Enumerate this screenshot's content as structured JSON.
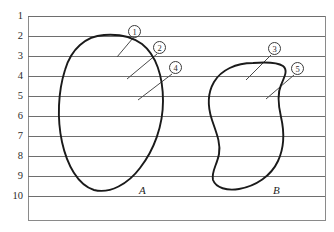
{
  "figure": {
    "type": "ruled-line-diagram",
    "frame": {
      "x": 28,
      "y": 16,
      "width": 297,
      "height": 204,
      "border_color": "#8a8a8a"
    },
    "line_color": "#6e6e6e",
    "outline_color": "#1a1a1a",
    "background": "#ffffff"
  },
  "ruled_lines": {
    "label_header": "row",
    "rows": [
      {
        "label": "1",
        "y": 16
      },
      {
        "label": "2",
        "y": 36
      },
      {
        "label": "3",
        "y": 56
      },
      {
        "label": "4",
        "y": 76
      },
      {
        "label": "5",
        "y": 96
      },
      {
        "label": "6",
        "y": 116
      },
      {
        "label": "7",
        "y": 136
      },
      {
        "label": "8",
        "y": 156
      },
      {
        "label": "9",
        "y": 176
      },
      {
        "label": "10",
        "y": 196
      }
    ]
  },
  "shapes": [
    {
      "id": "shape-a",
      "label": "A",
      "label_x": 139,
      "label_y": 184,
      "path": "M 104 35 C 86 36, 71 49, 65 70 C 58 92, 57 119, 62 142 C 67 165, 78 185, 94 190 C 110 194, 128 184, 140 168 C 154 150, 163 126, 163 101 C 163 76, 156 55, 142 44 C 131 36, 117 34, 104 35 Z"
    },
    {
      "id": "shape-b",
      "label": "B",
      "label_x": 273,
      "label_y": 184,
      "path": "M 253 63 C 236 63, 221 70, 214 82 C 207 94, 208 108, 212 120 C 216 132, 221 143, 219 154 C 217 165, 211 172, 213 180 C 216 188, 227 191, 239 189 C 256 186, 271 176, 278 161 C 285 146, 284 130, 281 117 C 278 104, 277 94, 281 85 C 285 76, 288 70, 283 66 C 277 62, 265 62, 253 63 Z"
    }
  ],
  "callouts": [
    {
      "id": "callout-1",
      "label": "①",
      "plain": "1",
      "circle_x": 128,
      "circle_y": 25,
      "leader": {
        "x1": 133,
        "y1": 38,
        "x2": 117,
        "y2": 57
      }
    },
    {
      "id": "callout-2",
      "label": "②",
      "plain": "2",
      "circle_x": 153,
      "circle_y": 41,
      "leader": {
        "x1": 157,
        "y1": 54,
        "x2": 127,
        "y2": 79
      }
    },
    {
      "id": "callout-4",
      "label": "④",
      "plain": "4",
      "circle_x": 169,
      "circle_y": 61,
      "leader": {
        "x1": 172,
        "y1": 74,
        "x2": 138,
        "y2": 100
      }
    },
    {
      "id": "callout-3",
      "label": "③",
      "plain": "3",
      "circle_x": 268,
      "circle_y": 42,
      "leader": {
        "x1": 271,
        "y1": 55,
        "x2": 246,
        "y2": 80
      }
    },
    {
      "id": "callout-5",
      "label": "⑤",
      "plain": "5",
      "circle_x": 291,
      "circle_y": 62,
      "leader": {
        "x1": 294,
        "y1": 75,
        "x2": 266,
        "y2": 99
      }
    }
  ]
}
